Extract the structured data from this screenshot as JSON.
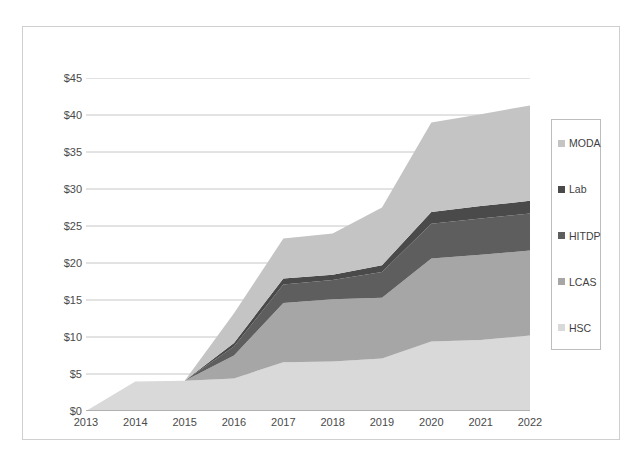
{
  "chart_data": {
    "type": "area",
    "stacked": true,
    "title": "",
    "xlabel": "",
    "ylabel": "Annual Budget (RY$M)",
    "categories": [
      2013,
      2014,
      2015,
      2016,
      2017,
      2018,
      2019,
      2020,
      2021,
      2022
    ],
    "x_tick_labels": [
      "2013",
      "2014",
      "2015",
      "2016",
      "2017",
      "2018",
      "2019",
      "2020",
      "2021",
      "2022"
    ],
    "y_tick_labels": [
      "$0",
      "$5",
      "$10",
      "$15",
      "$20",
      "$25",
      "$30",
      "$35",
      "$40",
      "$45"
    ],
    "y_tick_values": [
      0,
      5,
      10,
      15,
      20,
      25,
      30,
      35,
      40,
      45
    ],
    "ylim": [
      0,
      45
    ],
    "grid": "horizontal",
    "legend_position": "right",
    "series": [
      {
        "name": "HSC",
        "color": "#d9d9d9",
        "values": [
          0.0,
          4.0,
          4.1,
          4.4,
          6.6,
          6.7,
          7.1,
          9.4,
          9.6,
          10.2
        ]
      },
      {
        "name": "LCAS",
        "color": "#a6a6a6",
        "values": [
          0.0,
          0.0,
          0.0,
          3.1,
          8.0,
          8.4,
          8.2,
          11.2,
          11.5,
          11.5
        ]
      },
      {
        "name": "HITDP",
        "color": "#5e5e5e",
        "values": [
          0.0,
          0.0,
          0.0,
          1.2,
          2.5,
          2.6,
          3.5,
          4.7,
          4.9,
          5.0
        ]
      },
      {
        "name": "Lab",
        "color": "#4a4a4a",
        "values": [
          0.0,
          0.0,
          0.0,
          0.5,
          0.8,
          0.7,
          0.9,
          1.6,
          1.7,
          1.7
        ]
      },
      {
        "name": "MODA",
        "color": "#c4c4c4",
        "values": [
          0.0,
          0.0,
          0.0,
          4.0,
          5.4,
          5.6,
          7.8,
          12.1,
          12.4,
          12.9
        ]
      }
    ],
    "totals": [
      0.0,
      4.0,
      4.1,
      13.2,
      23.3,
      24.0,
      27.5,
      39.0,
      40.1,
      41.3
    ]
  },
  "legend": {
    "items": [
      {
        "label": "MODA",
        "color": "#c4c4c4"
      },
      {
        "label": "Lab",
        "color": "#4a4a4a"
      },
      {
        "label": "HITDP",
        "color": "#5e5e5e"
      },
      {
        "label": "LCAS",
        "color": "#a6a6a6"
      },
      {
        "label": "HSC",
        "color": "#d9d9d9"
      }
    ]
  },
  "axes": {
    "y_title": "Annual Budget (RY$M)"
  },
  "style": {
    "gridline_color": "#b7b7b7",
    "axis_color": "#868686",
    "frame_color": "#cfcfcf",
    "plot_background": "#ffffff"
  }
}
